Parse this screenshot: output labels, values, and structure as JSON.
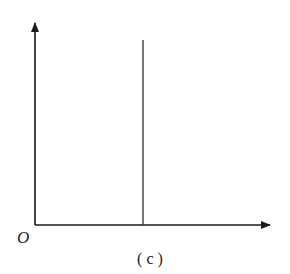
{
  "diagram": {
    "type": "axes-with-vertical-line",
    "origin_label": "O",
    "caption": "( c )",
    "colors": {
      "axis": "#1a1a1a",
      "line": "#3a3a3a"
    }
  }
}
